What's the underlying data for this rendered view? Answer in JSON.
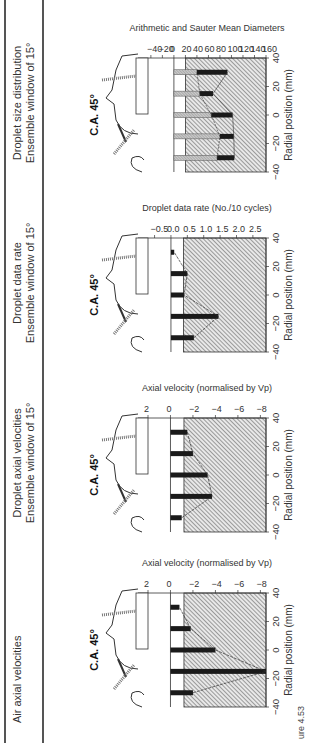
{
  "figure": {
    "caption": "ure 4.53",
    "angle_label": "C.A. 45°",
    "columns": [
      {
        "title": "Air axial velocities",
        "subtitle": ""
      },
      {
        "title": "Droplet axial velocities",
        "subtitle": "Ensemble window of 15°"
      },
      {
        "title": "Droplet data rate",
        "subtitle": "Ensemble window of 15°"
      },
      {
        "title": "Droplet size distribution",
        "subtitle": "Ensemble window of 15°"
      }
    ]
  },
  "chart_data": [
    {
      "type": "bar",
      "title": "Air axial velocities",
      "xlabel": "Radial position (mm)",
      "ylabel": "Axial velocity (normalised by Vp)",
      "x_ticks": [
        "−40",
        "−20",
        "0",
        "20",
        "40"
      ],
      "y_ticks": [
        "2",
        "0",
        "−2",
        "−4",
        "−6",
        "−8"
      ],
      "xlim": [
        -40,
        40
      ],
      "ylim": [
        2,
        -8.5
      ],
      "categories": [
        -30,
        -15,
        0,
        15,
        30
      ],
      "values": [
        -2.0,
        -8.5,
        -4.0,
        -1.8,
        -0.8
      ],
      "annotation": "C.A. 45°"
    },
    {
      "type": "bar",
      "title": "Droplet axial velocities",
      "subtitle": "Ensemble window of 15°",
      "xlabel": "Radial position (mm)",
      "ylabel": "Axial velocity (normalised by Vp)",
      "x_ticks": [
        "−40",
        "−20",
        "0",
        "20",
        "40"
      ],
      "y_ticks": [
        "2",
        "0",
        "−2",
        "−4",
        "−6",
        "−8"
      ],
      "xlim": [
        -40,
        40
      ],
      "ylim": [
        2,
        -8.5
      ],
      "categories": [
        -30,
        -15,
        0,
        15,
        30
      ],
      "values": [
        -1.0,
        -3.7,
        -3.3,
        -2.0,
        -1.5
      ],
      "annotation": "C.A. 45°"
    },
    {
      "type": "bar",
      "title": "Droplet data rate",
      "subtitle": "Ensemble window of 15°",
      "xlabel": "Radial position (mm)",
      "ylabel": "Droplet data rate (No./10 cycles)",
      "x_ticks": [
        "−40",
        "−20",
        "0",
        "20",
        "40"
      ],
      "y_ticks": [
        "−0.5",
        "0.0",
        "0.5",
        "1.0",
        "1.5",
        "2.0",
        "2.5"
      ],
      "xlim": [
        -40,
        40
      ],
      "ylim": [
        -0.7,
        2.9
      ],
      "categories": [
        -30,
        -15,
        0,
        15,
        30
      ],
      "values": [
        0.7,
        1.45,
        0.4,
        0.5,
        0.1
      ],
      "annotation": "C.A. 45°"
    },
    {
      "type": "bar",
      "title": "Droplet size distribution",
      "subtitle": "Ensemble window of 15°",
      "xlabel": "Radial position (mm)",
      "ylabel": "Arithmetic and Sauter Mean Diameters",
      "x_ticks": [
        "−40",
        "−20",
        "0",
        "20",
        "40"
      ],
      "y_ticks": [
        "−40",
        "−20",
        "0",
        "20",
        "40",
        "60",
        "80",
        "100",
        "120",
        "140",
        "160"
      ],
      "xlim": [
        -40,
        40
      ],
      "ylim": [
        -45,
        160
      ],
      "categories": [
        -30,
        -15,
        0,
        15,
        30
      ],
      "series": [
        {
          "name": "Arithmetic mean diameter",
          "values": [
            75,
            80,
            65,
            45,
            40
          ]
        },
        {
          "name": "Sauter mean diameter",
          "values": [
            105,
            104,
            102,
            68,
            93
          ]
        }
      ],
      "annotation": "C.A. 45°"
    }
  ]
}
